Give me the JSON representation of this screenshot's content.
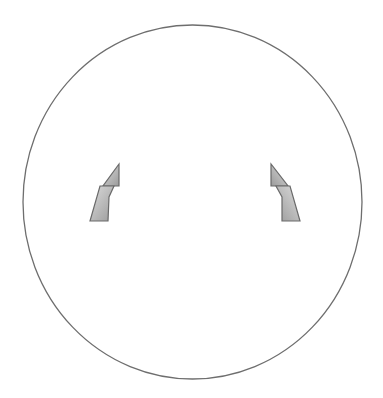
{
  "figure": {
    "width": 383,
    "height": 398,
    "background": "#ffffff",
    "circle": {
      "cx": 192.5,
      "cy": 202,
      "rx": 169.5,
      "ry": 177,
      "stroke": "#6e6e6e",
      "stroke_width": 1.3
    },
    "shapes": {
      "stroke": "#6a6a6a",
      "fill_light": "#dcdcdc",
      "fill_dark": "#9a9a9a",
      "left": {
        "upper": "119,164 119,186 103,186",
        "lower": "100,186 114,186 109,197 108,221 90,221"
      },
      "right": {
        "upper": "271,164 271,186 288,186",
        "lower": "276,186 290,186 300,221 282,221 282,197"
      }
    }
  }
}
